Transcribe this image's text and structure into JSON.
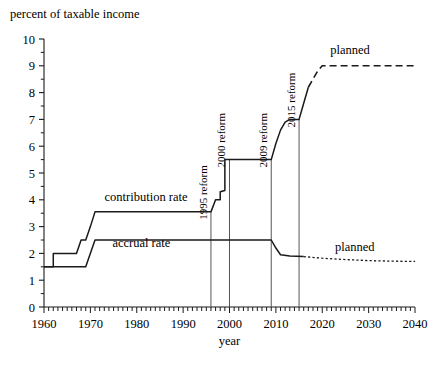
{
  "chart_data": {
    "type": "line",
    "title": "",
    "ylabel": "percent of taxable income",
    "xlabel": "year",
    "xlim": [
      1960,
      2040
    ],
    "ylim": [
      0,
      10
    ],
    "grid": false,
    "legend_position": "inline-annotations",
    "xticks": [
      1960,
      1970,
      1980,
      1990,
      2000,
      2010,
      2020,
      2030,
      2040
    ],
    "xtick_labels": [
      "1960",
      "1970",
      "1980",
      "1990",
      "2000",
      "2010",
      "2020",
      "2030",
      "2040"
    ],
    "x_minor_tick_interval": 1,
    "yticks": [
      0,
      1,
      2,
      3,
      4,
      5,
      6,
      7,
      8,
      9,
      10
    ],
    "ytick_labels": [
      "0",
      "1",
      "2",
      "3",
      "4",
      "5",
      "6",
      "7",
      "8",
      "9",
      "10"
    ],
    "y_minor_tick_interval": 0.5,
    "series": [
      {
        "name": "contribution rate",
        "style": "solid",
        "points": [
          [
            1960,
            1.5
          ],
          [
            1962,
            1.5
          ],
          [
            1962,
            2.0
          ],
          [
            1966,
            2.0
          ],
          [
            1967,
            2.0
          ],
          [
            1968,
            2.5
          ],
          [
            1969,
            2.5
          ],
          [
            1970,
            3.0
          ],
          [
            1971,
            3.55
          ],
          [
            1996,
            3.55
          ],
          [
            1997,
            4.0
          ],
          [
            1998,
            4.0
          ],
          [
            1998,
            4.3
          ],
          [
            1999,
            4.35
          ],
          [
            1999,
            5.5
          ],
          [
            2000,
            5.5
          ],
          [
            2009,
            5.5
          ],
          [
            2010,
            6.1
          ],
          [
            2011,
            6.6
          ],
          [
            2012,
            6.9
          ],
          [
            2013,
            7.0
          ],
          [
            2015,
            7.0
          ],
          [
            2016,
            7.6
          ],
          [
            2017,
            8.2
          ]
        ]
      },
      {
        "name": "contribution rate planned",
        "style": "dashed",
        "points": [
          [
            2017,
            8.2
          ],
          [
            2019,
            8.8
          ],
          [
            2020,
            9.0
          ],
          [
            2040,
            9.0
          ]
        ]
      },
      {
        "name": "accrual rate",
        "style": "solid",
        "points": [
          [
            1960,
            1.5
          ],
          [
            1969,
            1.5
          ],
          [
            1971,
            2.5
          ],
          [
            2009,
            2.5
          ],
          [
            2010,
            2.2
          ],
          [
            2011,
            1.95
          ],
          [
            2013,
            1.9
          ],
          [
            2016,
            1.88
          ]
        ]
      },
      {
        "name": "accrual rate planned",
        "style": "dotted",
        "points": [
          [
            2016,
            1.88
          ],
          [
            2020,
            1.82
          ],
          [
            2025,
            1.77
          ],
          [
            2030,
            1.73
          ],
          [
            2035,
            1.71
          ],
          [
            2040,
            1.7
          ]
        ]
      }
    ],
    "annotations": [
      {
        "name": "contribution-rate-label",
        "text": "contribution rate",
        "x": 1982,
        "y": 3.95
      },
      {
        "name": "accrual-rate-label",
        "text": "accrual rate",
        "x": 1981,
        "y": 2.25
      },
      {
        "name": "planned-upper-label",
        "text": "planned",
        "x": 2026,
        "y": 9.45
      },
      {
        "name": "planned-lower-label",
        "text": "planned",
        "x": 2027,
        "y": 2.1
      }
    ],
    "reform_markers": [
      {
        "name": "reform-1995",
        "label": "1995 reform",
        "year": 1996,
        "top_value": 3.55
      },
      {
        "name": "reform-2000",
        "label": "2000 reform",
        "year": 2000,
        "top_value": 5.5
      },
      {
        "name": "reform-2009",
        "label": "2009 reform",
        "year": 2009,
        "top_value": 5.5
      },
      {
        "name": "reform-2015",
        "label": "2015 reform",
        "year": 2015,
        "top_value": 7.0
      }
    ],
    "colors": {
      "line": "#1a1a1a",
      "axis": "#1a1a1a",
      "reform_marker": "#555555",
      "background": "#ffffff"
    }
  }
}
